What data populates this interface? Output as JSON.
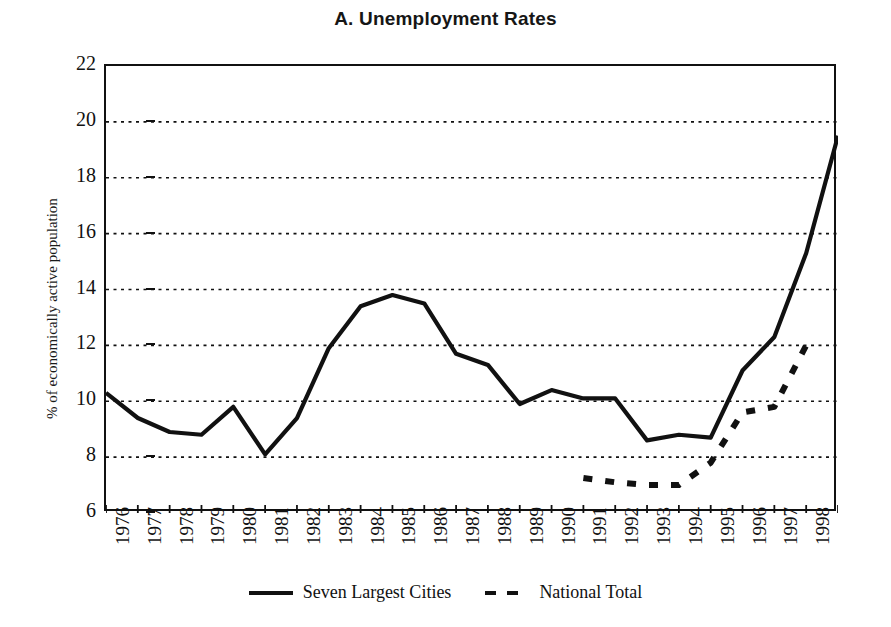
{
  "title": "A. Unemployment Rates",
  "axis": {
    "ylabel": "% of economically active population",
    "xlabel": ""
  },
  "legend": {
    "items": [
      {
        "label": "Seven Largest Cities",
        "style": "solid"
      },
      {
        "label": "National Total",
        "style": "dashed"
      }
    ]
  },
  "chart_data": {
    "type": "line",
    "title": "A. Unemployment Rates",
    "xlabel": "",
    "ylabel": "% of economically active population",
    "ylim": [
      6,
      22
    ],
    "yticks": [
      6,
      8,
      10,
      12,
      14,
      16,
      18,
      20,
      22
    ],
    "grid": "horizontal-dotted",
    "legend_position": "bottom-center",
    "categories": [
      "1976",
      "1977",
      "1978",
      "1979",
      "1980",
      "1981",
      "1982",
      "1983",
      "1984",
      "1985",
      "1986",
      "1987",
      "1988",
      "1989",
      "1990",
      "1991",
      "1992",
      "1993",
      "1994",
      "1995",
      "1996",
      "1997",
      "1998",
      "1999"
    ],
    "series": [
      {
        "name": "Seven Largest Cities",
        "style": "solid",
        "x": [
          "1976",
          "1977",
          "1978",
          "1979",
          "1980",
          "1981",
          "1982",
          "1983",
          "1984",
          "1985",
          "1986",
          "1987",
          "1988",
          "1989",
          "1990",
          "1991",
          "1992",
          "1993",
          "1994",
          "1995",
          "1996",
          "1997",
          "1998",
          "1999"
        ],
        "values": [
          10.3,
          9.4,
          8.9,
          8.8,
          9.8,
          8.1,
          9.4,
          11.9,
          13.4,
          13.8,
          13.5,
          11.7,
          11.3,
          9.9,
          10.4,
          10.1,
          10.1,
          8.6,
          8.8,
          8.7,
          11.1,
          12.3,
          15.3,
          19.5
        ]
      },
      {
        "name": "National Total",
        "style": "dashed",
        "x": [
          "1991",
          "1992",
          "1993",
          "1994",
          "1995",
          "1996",
          "1997",
          "1998"
        ],
        "values": [
          7.25,
          7.1,
          7.0,
          7.0,
          7.8,
          9.6,
          9.8,
          12.0
        ]
      }
    ]
  }
}
